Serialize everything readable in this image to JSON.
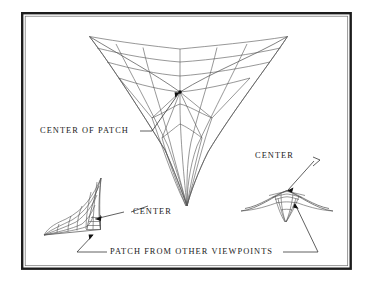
{
  "figure": {
    "background_color": "#ffffff",
    "frame": {
      "border_color": "#1c1c1c",
      "x": 21,
      "y": 12,
      "width": 331,
      "height": 258
    },
    "mesh_color": "#585858",
    "leader_color": "#2b2b2b",
    "text_color": "#1a1a1a"
  },
  "labels": {
    "center_of_patch": "CENTER OF PATCH",
    "center_left": "CENTER",
    "center_right": "CENTER",
    "patch_from_other_viewpoints": "PATCH FROM OTHER VIEWPOINTS"
  },
  "views": {
    "main": {
      "name": "main-patch-view",
      "caption": "CENTER OF PATCH"
    },
    "lower_left": {
      "name": "patch-view-lower-left",
      "caption": "CENTER"
    },
    "lower_right": {
      "name": "patch-view-lower-right",
      "caption": "CENTER"
    }
  }
}
